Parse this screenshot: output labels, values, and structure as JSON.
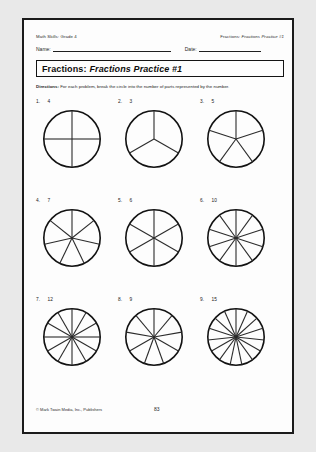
{
  "header": {
    "left": "Math Skills: Grade 4",
    "right_prefix": "Fractions:",
    "right_title": "Fractions Practice #1",
    "name_label": "Name:",
    "date_label": "Date:"
  },
  "title": {
    "main": "Fractions:",
    "sub": "Fractions Practice #1"
  },
  "directions": {
    "label": "Directions:",
    "text": "For each problem, break the circle into the number of parts represented by the number."
  },
  "problems": [
    {
      "number": "1.",
      "parts": "4"
    },
    {
      "number": "2.",
      "parts": "3"
    },
    {
      "number": "3.",
      "parts": "5"
    },
    {
      "number": "4.",
      "parts": "7"
    },
    {
      "number": "5.",
      "parts": "6"
    },
    {
      "number": "6.",
      "parts": "10"
    },
    {
      "number": "7.",
      "parts": "12"
    },
    {
      "number": "8.",
      "parts": "9"
    },
    {
      "number": "9.",
      "parts": "15"
    }
  ],
  "footer": {
    "copyright": "© Mark Twain Media, Inc., Publishers",
    "page": "83"
  },
  "colors": {
    "ink": "#121212",
    "paper": "#fdfdfd",
    "surround": "#e9e9e9"
  }
}
